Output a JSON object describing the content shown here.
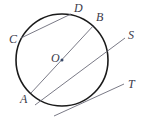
{
  "diagram": {
    "type": "circle-geometry",
    "circle": {
      "center_label": "O",
      "cx": 62,
      "cy": 60,
      "r": 46,
      "stroke": "#1a1a1a"
    },
    "points": {
      "A": {
        "label": "A",
        "x": 31,
        "y": 93,
        "lx": 21,
        "ly": 102
      },
      "B": {
        "label": "B",
        "x": 94,
        "y": 25,
        "lx": 96,
        "ly": 21
      },
      "C": {
        "label": "C",
        "x": 21,
        "y": 38,
        "lx": 10,
        "ly": 42
      },
      "D": {
        "label": "D",
        "x": 71,
        "y": 14,
        "lx": 74,
        "ly": 12
      },
      "O": {
        "label": "O",
        "x": 62,
        "y": 60,
        "lx": 52,
        "ly": 62
      },
      "S": {
        "label": "S",
        "x": 125,
        "y": 38,
        "lx": 129,
        "ly": 39
      },
      "T": {
        "label": "T",
        "x": 124,
        "y": 84,
        "lx": 129,
        "ly": 88
      }
    },
    "segments": [
      {
        "name": "chord-CD",
        "from": "C",
        "to": "D"
      },
      {
        "name": "diameter-AB",
        "from": "A",
        "to": "B"
      },
      {
        "name": "secant-S",
        "x1": 35,
        "y1": 105,
        "x2": 125,
        "y2": 38
      },
      {
        "name": "tangent-T",
        "x1": 54,
        "y1": 116,
        "x2": 124,
        "y2": 84
      }
    ],
    "line_color": "#6b6b78",
    "label_color": "#3a3a4a"
  }
}
